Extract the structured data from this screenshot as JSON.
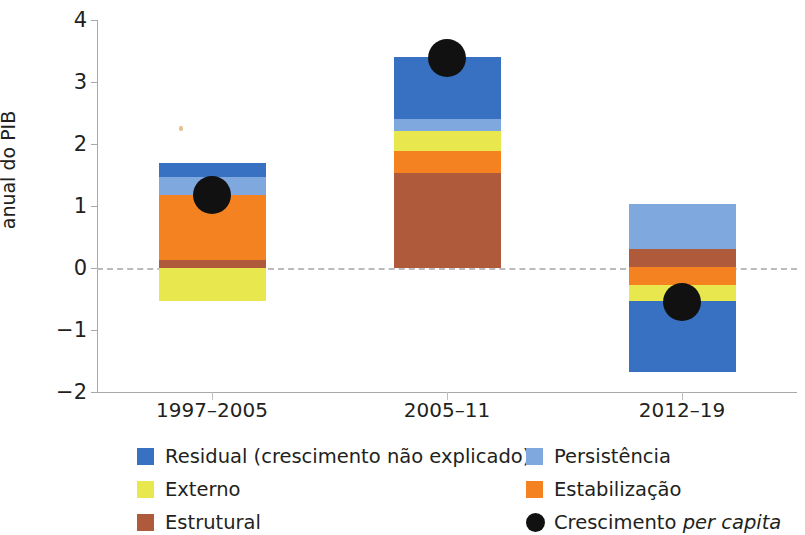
{
  "chart_data": {
    "type": "bar",
    "subtype": "stacked-bar-with-overlay-points",
    "title": "",
    "xlabel": "",
    "ylabel": "Taxa de crescimento média anual do PIB",
    "categories": [
      "1997–2005",
      "2005–11",
      "2012–19"
    ],
    "ylim": [
      -2,
      4
    ],
    "yticks": [
      -2,
      -1,
      0,
      1,
      2,
      3,
      4
    ],
    "ytick_labels": [
      "−2",
      "−1",
      "0",
      "1",
      "2",
      "3",
      "4"
    ],
    "grid": false,
    "zero_line": true,
    "legend_position": "bottom",
    "series": [
      {
        "name": "Residual (crescimento não explicado)",
        "color": "#3871c2",
        "values": [
          0.24,
          1.0,
          -1.14
        ]
      },
      {
        "name": "Persistência",
        "color": "#7fa8de",
        "values": [
          0.29,
          0.19,
          0.73
        ]
      },
      {
        "name": "Externo",
        "color": "#e8e84e",
        "values": [
          -0.54,
          0.32,
          -0.25
        ]
      },
      {
        "name": "Estabilização",
        "color": "#f58220",
        "values": [
          1.04,
          0.35,
          -0.29
        ]
      },
      {
        "name": "Estrutural",
        "color": "#b05a3c",
        "values": [
          0.13,
          1.54,
          0.29
        ]
      }
    ],
    "overlay_points": {
      "name": "Crescimento per capita",
      "color": "#111111",
      "marker": "circle",
      "values": [
        1.18,
        3.38,
        -0.55
      ]
    },
    "bar_totals_positive": [
      1.7,
      3.4,
      1.03
    ],
    "bar_totals_negative": [
      -0.54,
      0.0,
      -1.62
    ]
  },
  "axis": {
    "y_title_line1": "Taxa de crescimento média",
    "y_title_line2": "anual do PIB"
  },
  "legend": {
    "items": [
      {
        "label": "Residual (crescimento não explicado)",
        "color": "#3871c2",
        "marker": "square",
        "col": 0,
        "row": 0
      },
      {
        "label": "Externo",
        "color": "#e8e84e",
        "marker": "square",
        "col": 0,
        "row": 1
      },
      {
        "label": "Estrutural",
        "color": "#b05a3c",
        "marker": "square",
        "col": 0,
        "row": 2
      },
      {
        "label": "Persistência",
        "color": "#7fa8de",
        "marker": "square",
        "col": 1,
        "row": 0
      },
      {
        "label": "Estabilização",
        "color": "#f58220",
        "marker": "square",
        "col": 1,
        "row": 1
      },
      {
        "label_plain": "Crescimento ",
        "label_italic": "per capita",
        "label": "Crescimento per capita",
        "color": "#111111",
        "marker": "circle",
        "col": 1,
        "row": 2
      }
    ]
  }
}
